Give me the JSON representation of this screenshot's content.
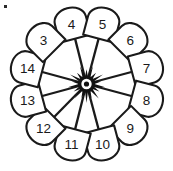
{
  "diagram": {
    "title": "Radial wheel diagram with twelve numbered arch nodes",
    "type": "radial-spoke-wheel",
    "node_count": 12,
    "shape_name": "arch",
    "center": {
      "x": 86.5,
      "y": 84.0
    },
    "hub": {
      "name": "starburst-hub",
      "spike_count": 18,
      "outer_radius": 19.0,
      "ring_outer_radius": 8.6,
      "ring_mid_radius": 5.2,
      "ring_inner_radius": 2.6,
      "color": "#121212"
    },
    "ring_radius": 62.0,
    "colors": {
      "stroke": "#1a1a1a",
      "fill": "#ffffff",
      "background": "#ffffff",
      "hub": "#121212",
      "label": "#1a1a1a"
    },
    "nodes": [
      {
        "label": "4",
        "angle_deg": -105,
        "cx": 71.4,
        "cy": 24.1,
        "rotation_deg": -15,
        "has_spoke": true
      },
      {
        "label": "5",
        "angle_deg": -75,
        "cx": 102.5,
        "cy": 24.1,
        "rotation_deg": 15,
        "has_spoke": true
      },
      {
        "label": "6",
        "angle_deg": -45,
        "cx": 130.3,
        "cy": 40.2,
        "rotation_deg": 45,
        "has_spoke": false
      },
      {
        "label": "7",
        "angle_deg": -15,
        "cx": 146.4,
        "cy": 68.0,
        "rotation_deg": 75,
        "has_spoke": true
      },
      {
        "label": "8",
        "angle_deg": 15,
        "cx": 146.4,
        "cy": 100.0,
        "rotation_deg": 105,
        "has_spoke": true
      },
      {
        "label": "9",
        "angle_deg": 45,
        "cx": 130.3,
        "cy": 127.8,
        "rotation_deg": 135,
        "has_spoke": false
      },
      {
        "label": "10",
        "angle_deg": 75,
        "cx": 102.5,
        "cy": 143.9,
        "rotation_deg": 165,
        "has_spoke": true
      },
      {
        "label": "11",
        "angle_deg": 105,
        "cx": 71.4,
        "cy": 143.9,
        "rotation_deg": 195,
        "has_spoke": true
      },
      {
        "label": "12",
        "angle_deg": 135,
        "cx": 43.6,
        "cy": 127.8,
        "rotation_deg": 225,
        "has_spoke": true
      },
      {
        "label": "13",
        "angle_deg": 165,
        "cx": 27.5,
        "cy": 100.0,
        "rotation_deg": 255,
        "has_spoke": true
      },
      {
        "label": "14",
        "angle_deg": 195,
        "cx": 27.5,
        "cy": 68.0,
        "rotation_deg": 285,
        "has_spoke": true
      },
      {
        "label": "3",
        "angle_deg": 225,
        "cx": 43.6,
        "cy": 40.2,
        "rotation_deg": 315,
        "has_spoke": false
      }
    ],
    "corner_mark": {
      "name": "corner-dot",
      "x": 4,
      "y": 5,
      "size": 3
    }
  }
}
